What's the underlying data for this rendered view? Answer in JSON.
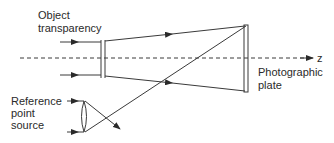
{
  "diagram": {
    "labels": {
      "object_line1": "Object",
      "object_line2": "transparency",
      "reference_line1": "Reference",
      "reference_line2": "point",
      "reference_line3": "source",
      "axis": "z",
      "plate_line1": "Photographic",
      "plate_line2": "plate"
    },
    "colors": {
      "line": "#3a3a3a",
      "background": "#ffffff"
    }
  }
}
